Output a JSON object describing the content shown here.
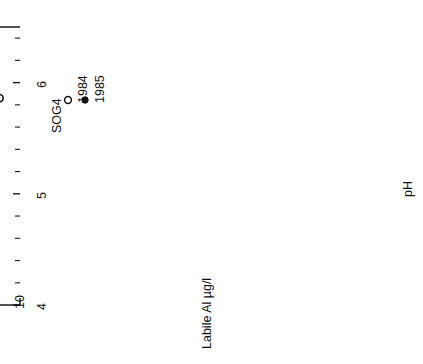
{
  "figure": {
    "site_label": "SOG4",
    "rotation_note": "figure-rotated-90",
    "legend": [
      {
        "marker": "open-circle",
        "label": "1984"
      },
      {
        "marker": "filled-circle",
        "label": "1985"
      }
    ],
    "annotations": [
      {
        "name": "slope-label-1984",
        "text": "9.1"
      },
      {
        "name": "slope-label-1985",
        "text": "7.7"
      }
    ]
  },
  "chart_data": {
    "type": "scatter",
    "title": "",
    "xlabel": "pH",
    "ylabel": "Labile Al µg/l",
    "xlim": [
      4,
      6.5
    ],
    "ylim": [
      10,
      1000
    ],
    "yscale": "log",
    "grid": false,
    "legend_position": "top-left",
    "xticks": [
      4,
      5,
      6
    ],
    "xticklabels": [
      "4",
      "5",
      "6"
    ],
    "xminorticks": [
      4.2,
      4.4,
      4.6,
      4.8,
      5.2,
      5.4,
      5.6,
      5.8,
      6.2,
      6.4
    ],
    "yticks": [
      1000,
      500,
      200,
      100,
      50,
      20,
      10
    ],
    "yticklabels": [
      "1000",
      "500",
      "200",
      "100",
      "50",
      "20",
      "10"
    ],
    "series": [
      {
        "name": "1984",
        "marker": "open-circle",
        "points": [
          [
            4.12,
            820
          ],
          [
            4.14,
            600
          ],
          [
            4.2,
            540
          ],
          [
            4.23,
            700
          ],
          [
            4.3,
            610
          ],
          [
            4.33,
            560
          ],
          [
            4.36,
            480
          ],
          [
            4.38,
            520
          ],
          [
            4.42,
            620
          ],
          [
            4.45,
            560
          ],
          [
            4.47,
            500
          ],
          [
            4.5,
            545
          ],
          [
            4.52,
            470
          ],
          [
            4.56,
            520
          ],
          [
            4.6,
            430
          ],
          [
            4.64,
            400
          ],
          [
            4.7,
            390
          ],
          [
            4.8,
            300
          ],
          [
            4.3,
            430
          ],
          [
            4.26,
            330
          ],
          [
            5.0,
            120
          ],
          [
            5.18,
            118
          ],
          [
            5.22,
            95
          ],
          [
            5.3,
            70
          ],
          [
            5.42,
            60
          ],
          [
            5.5,
            47
          ],
          [
            5.58,
            40
          ],
          [
            5.8,
            30
          ],
          [
            5.88,
            26
          ],
          [
            5.95,
            24
          ],
          [
            6.0,
            22
          ],
          [
            6.02,
            20
          ],
          [
            6.05,
            19
          ],
          [
            6.08,
            18
          ],
          [
            6.1,
            24
          ],
          [
            6.12,
            17
          ],
          [
            6.18,
            22
          ],
          [
            5.82,
            26
          ],
          [
            5.84,
            24
          ],
          [
            5.86,
            13
          ]
        ]
      },
      {
        "name": "1985",
        "marker": "filled-circle",
        "points": [
          [
            4.05,
            350
          ],
          [
            4.08,
            340
          ],
          [
            4.16,
            300
          ],
          [
            4.2,
            250
          ],
          [
            4.26,
            215
          ],
          [
            4.32,
            170
          ],
          [
            4.36,
            165
          ],
          [
            4.4,
            160
          ],
          [
            4.42,
            158
          ],
          [
            4.44,
            152
          ],
          [
            4.5,
            205
          ],
          [
            4.6,
            145
          ],
          [
            4.74,
            230
          ],
          [
            4.86,
            150
          ],
          [
            4.9,
            135
          ],
          [
            4.96,
            118
          ],
          [
            4.98,
            122
          ],
          [
            5.02,
            108
          ],
          [
            5.06,
            100
          ],
          [
            5.08,
            95
          ],
          [
            5.12,
            88
          ],
          [
            5.2,
            78
          ],
          [
            5.28,
            65
          ],
          [
            5.4,
            60
          ],
          [
            5.48,
            47
          ],
          [
            5.56,
            42
          ],
          [
            5.62,
            55
          ],
          [
            5.7,
            30
          ],
          [
            5.86,
            22
          ],
          [
            5.92,
            24
          ],
          [
            6.02,
            20
          ],
          [
            5.25,
            18
          ],
          [
            4.52,
            190
          ]
        ]
      }
    ],
    "regression_lines": [
      {
        "name": "1984-fit",
        "label": "9.1",
        "x": [
          4.02,
          4.86
        ],
        "y": [
          880,
          150
        ]
      },
      {
        "name": "1985-fit",
        "label": "7.7",
        "x": [
          4.0,
          4.88
        ],
        "y": [
          330,
          128
        ]
      }
    ]
  }
}
